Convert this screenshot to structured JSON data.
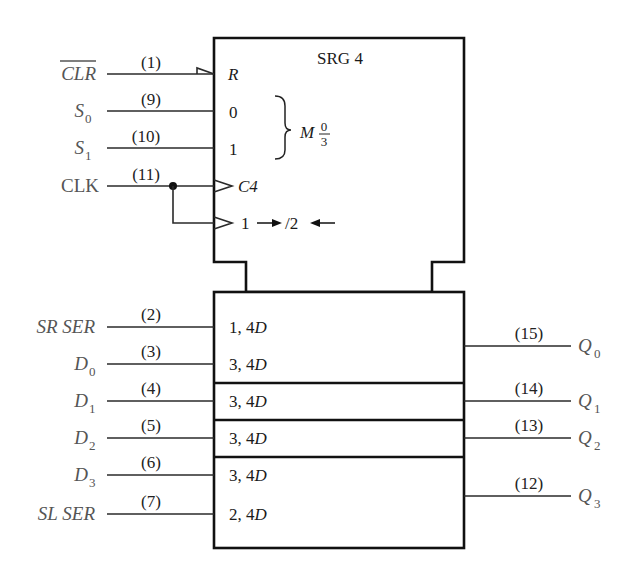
{
  "diagram": {
    "title": "SRG 4",
    "control_block": {
      "inputs": [
        {
          "label": "CLR",
          "overbar": true,
          "pin": "(1)",
          "inner": "R"
        },
        {
          "label": "S",
          "sub": "0",
          "pin": "(9)",
          "inner": "0"
        },
        {
          "label": "S",
          "sub": "1",
          "pin": "(10)",
          "inner": "1"
        },
        {
          "label": "CLK",
          "pin": "(11)",
          "inner": "C4"
        }
      ],
      "mode_label": "M",
      "mode_num": "0",
      "mode_den": "3",
      "shift_label": "1 → /2 ←",
      "shift_parts": {
        "a": "1",
        "b": "/2"
      }
    },
    "data_block": {
      "inputs": [
        {
          "label": "SR SER",
          "pin": "(2)",
          "inner_num": "1, 4",
          "inner_d": "D"
        },
        {
          "label": "D",
          "sub": "0",
          "pin": "(3)",
          "inner_num": "3, 4",
          "inner_d": "D"
        },
        {
          "label": "D",
          "sub": "1",
          "pin": "(4)",
          "inner_num": "3, 4",
          "inner_d": "D"
        },
        {
          "label": "D",
          "sub": "2",
          "pin": "(5)",
          "inner_num": "3, 4",
          "inner_d": "D"
        },
        {
          "label": "D",
          "sub": "3",
          "pin": "(6)",
          "inner_num": "3, 4",
          "inner_d": "D"
        },
        {
          "label": "SL SER",
          "pin": "(7)",
          "inner_num": "2, 4",
          "inner_d": "D"
        }
      ],
      "outputs": [
        {
          "label": "Q",
          "sub": "0",
          "pin": "(15)"
        },
        {
          "label": "Q",
          "sub": "1",
          "pin": "(14)"
        },
        {
          "label": "Q",
          "sub": "2",
          "pin": "(13)"
        },
        {
          "label": "Q",
          "sub": "3",
          "pin": "(12)"
        }
      ]
    }
  }
}
